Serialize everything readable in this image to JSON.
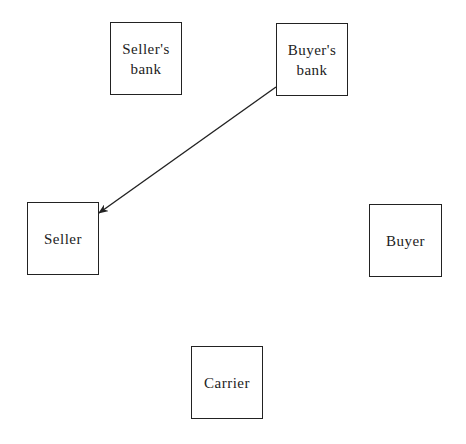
{
  "diagram": {
    "nodes": [
      {
        "id": "sellers-bank",
        "label": "Seller's\nbank",
        "x": 110,
        "y": 22,
        "w": 72,
        "h": 73
      },
      {
        "id": "buyers-bank",
        "label": "Buyer's\nbank",
        "x": 276,
        "y": 23,
        "w": 72,
        "h": 73
      },
      {
        "id": "seller",
        "label": "Seller",
        "x": 27,
        "y": 202,
        "w": 72,
        "h": 73
      },
      {
        "id": "buyer",
        "label": "Buyer",
        "x": 369,
        "y": 204,
        "w": 73,
        "h": 73
      },
      {
        "id": "carrier",
        "label": "Carrier",
        "x": 191,
        "y": 346,
        "w": 72,
        "h": 73
      }
    ],
    "edges": [
      {
        "from": "buyers-bank",
        "to": "seller",
        "x1": 276,
        "y1": 87,
        "x2": 99,
        "y2": 213,
        "arrow": "end"
      }
    ]
  }
}
